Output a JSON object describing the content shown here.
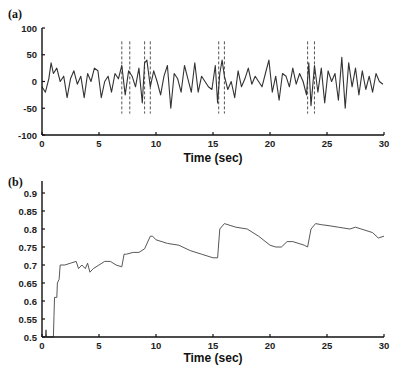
{
  "chart_data": [
    {
      "panel": "(a)",
      "type": "line",
      "title": "",
      "xlabel": "Time (sec)",
      "ylabel": "",
      "xlim": [
        0,
        30
      ],
      "ylim": [
        -100,
        100
      ],
      "xticks": [
        0,
        5,
        10,
        15,
        20,
        25,
        30
      ],
      "yticks": [
        -100,
        -50,
        0,
        50,
        100
      ],
      "grid": false,
      "legend": null,
      "description": "Noisy signal fluctuating around 0, mostly between -50 and +45",
      "series": [
        {
          "name": "signal",
          "x": [
            0,
            0.3,
            0.6,
            0.8,
            1.0,
            1.3,
            1.6,
            1.9,
            2.2,
            2.5,
            2.8,
            3.1,
            3.4,
            3.7,
            4.0,
            4.3,
            4.6,
            4.9,
            5.2,
            5.5,
            5.8,
            6.1,
            6.4,
            6.7,
            7.0,
            7.3,
            7.6,
            7.9,
            8.2,
            8.5,
            8.8,
            9.0,
            9.2,
            9.5,
            9.8,
            10.1,
            10.4,
            10.7,
            11.0,
            11.3,
            11.6,
            11.9,
            12.2,
            12.5,
            12.8,
            13.1,
            13.4,
            13.7,
            14.0,
            14.3,
            14.6,
            14.9,
            15.2,
            15.4,
            15.6,
            15.8,
            16.0,
            16.3,
            16.6,
            16.9,
            17.2,
            17.5,
            17.8,
            18.1,
            18.4,
            18.7,
            19.0,
            19.3,
            19.6,
            19.9,
            20.2,
            20.5,
            20.8,
            21.1,
            21.4,
            21.7,
            22.0,
            22.3,
            22.6,
            22.9,
            23.2,
            23.4,
            23.6,
            23.9,
            24.2,
            24.5,
            24.8,
            25.1,
            25.4,
            25.7,
            26.0,
            26.3,
            26.6,
            26.9,
            27.2,
            27.5,
            27.8,
            28.1,
            28.4,
            28.7,
            29.0,
            29.3,
            29.6,
            29.9
          ],
          "y": [
            -10,
            -20,
            5,
            35,
            15,
            25,
            0,
            10,
            -30,
            5,
            20,
            -5,
            10,
            -30,
            15,
            0,
            25,
            20,
            -30,
            0,
            10,
            -20,
            15,
            5,
            30,
            -25,
            20,
            10,
            -10,
            25,
            -40,
            35,
            40,
            -10,
            20,
            0,
            -25,
            10,
            30,
            -50,
            15,
            5,
            -20,
            30,
            5,
            -20,
            35,
            -20,
            10,
            0,
            -10,
            -15,
            30,
            -40,
            15,
            40,
            10,
            -15,
            0,
            -30,
            20,
            -10,
            5,
            25,
            -5,
            10,
            0,
            -10,
            15,
            40,
            -20,
            10,
            -35,
            15,
            10,
            -10,
            25,
            -5,
            15,
            0,
            -25,
            35,
            -45,
            30,
            -20,
            25,
            -40,
            20,
            0,
            15,
            -35,
            45,
            -50,
            35,
            -10,
            25,
            -25,
            20,
            -15,
            10,
            -20,
            15,
            0,
            -5
          ]
        }
      ],
      "annotations": {
        "type": "dashed vertical line pairs",
        "x": [
          7.0,
          7.7,
          9.0,
          9.5,
          15.5,
          16.0,
          23.3,
          23.9
        ],
        "y_range": [
          -60,
          75
        ]
      }
    },
    {
      "panel": "(b)",
      "type": "line",
      "title": "",
      "xlabel": "Time (sec)",
      "ylabel": "",
      "xlim": [
        0,
        30
      ],
      "ylim": [
        0.5,
        0.9
      ],
      "xticks": [
        0,
        5,
        10,
        15,
        20,
        25,
        30
      ],
      "yticks": [
        0.5,
        0.55,
        0.6,
        0.65,
        0.7,
        0.75,
        0.8,
        0.85,
        0.9
      ],
      "grid": false,
      "legend": null,
      "series": [
        {
          "name": "cumulative measure",
          "x": [
            0.3,
            0.35,
            0.4,
            0.45,
            1.0,
            1.05,
            1.1,
            1.3,
            1.35,
            1.5,
            1.6,
            2.0,
            2.5,
            3.0,
            3.2,
            3.5,
            3.8,
            4.0,
            4.2,
            4.5,
            5.0,
            5.5,
            6.0,
            6.5,
            7.0,
            7.2,
            7.4,
            8.0,
            8.5,
            9.0,
            9.5,
            9.7,
            10.0,
            11.0,
            12.0,
            13.0,
            14.0,
            15.0,
            15.4,
            15.6,
            16.0,
            16.5,
            17.0,
            18.0,
            19.0,
            20.0,
            20.5,
            21.0,
            21.5,
            22.0,
            23.0,
            23.3,
            23.6,
            24.0,
            24.5,
            25.0,
            26.0,
            27.0,
            27.5,
            28.0,
            29.0,
            29.5,
            30.0
          ],
          "y": [
            0.5,
            0.52,
            0.5,
            0.5,
            0.5,
            0.56,
            0.61,
            0.61,
            0.65,
            0.66,
            0.7,
            0.7,
            0.705,
            0.71,
            0.69,
            0.7,
            0.69,
            0.705,
            0.68,
            0.69,
            0.7,
            0.71,
            0.71,
            0.7,
            0.695,
            0.73,
            0.73,
            0.735,
            0.735,
            0.745,
            0.78,
            0.78,
            0.77,
            0.76,
            0.755,
            0.74,
            0.73,
            0.72,
            0.72,
            0.8,
            0.815,
            0.81,
            0.805,
            0.8,
            0.78,
            0.755,
            0.75,
            0.75,
            0.765,
            0.765,
            0.755,
            0.75,
            0.8,
            0.815,
            0.812,
            0.81,
            0.805,
            0.8,
            0.805,
            0.8,
            0.79,
            0.775,
            0.78
          ]
        }
      ]
    }
  ],
  "panels": {
    "a": {
      "label": "(a)",
      "xlabel": "Time (sec)",
      "xtick_labels": [
        "0",
        "5",
        "10",
        "15",
        "20",
        "25",
        "30"
      ],
      "ytick_labels": [
        "100",
        "50",
        "0",
        "-50",
        "-100"
      ]
    },
    "b": {
      "label": "(b)",
      "xlabel": "Time (sec)",
      "xtick_labels": [
        "0",
        "5",
        "10",
        "15",
        "20",
        "25",
        "30"
      ],
      "ytick_labels": [
        "0.9",
        "0.85",
        "0.8",
        "0.75",
        "0.7",
        "0.65",
        "0.6",
        "0.55",
        "0.5"
      ]
    }
  }
}
